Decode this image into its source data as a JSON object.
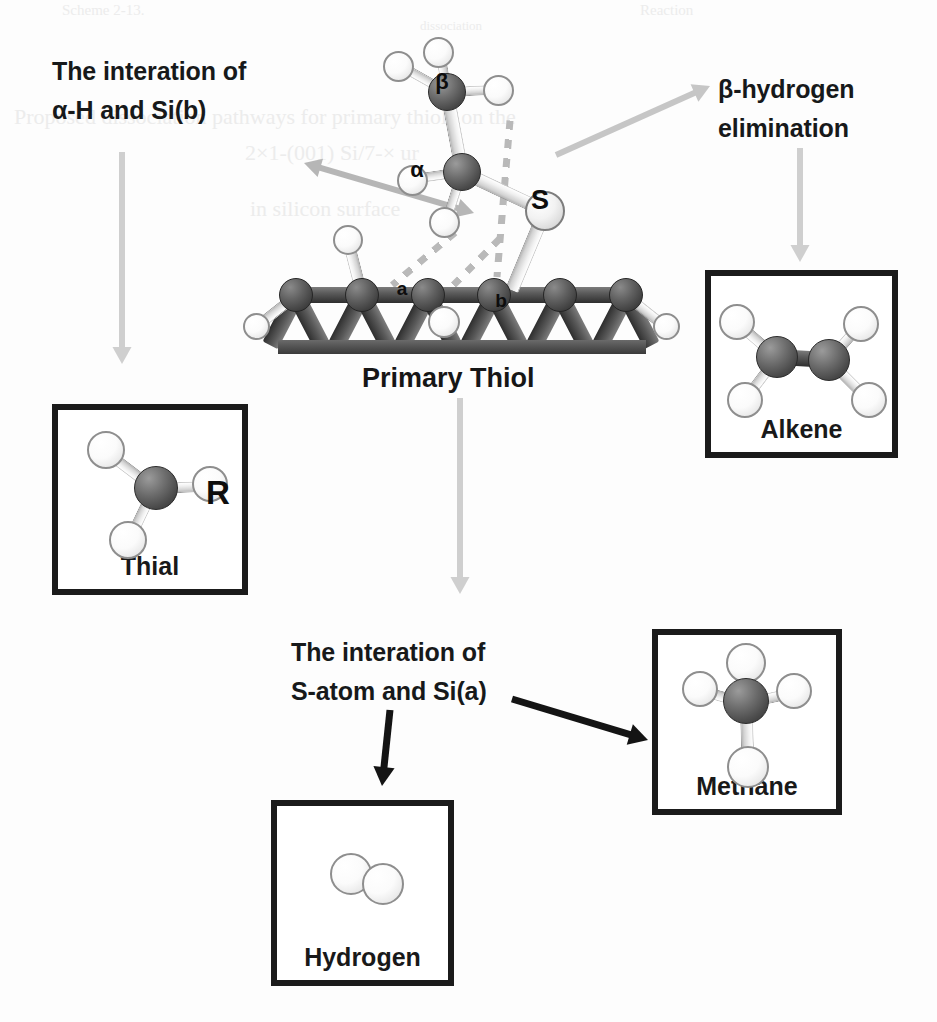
{
  "figure": {
    "background": "#fdfdfd",
    "center_caption": "Primary Thiol"
  },
  "ghost_text": [
    {
      "text": "Scheme 2-13.",
      "x": 62,
      "y": 2,
      "size": 15
    },
    {
      "text": "Reaction",
      "x": 640,
      "y": 2,
      "size": 15
    },
    {
      "text": "Proposed dissociation pathways for primary thiols on the",
      "x": 14,
      "y": 104,
      "size": 22
    },
    {
      "text": "2×1-(001) Si/7-× ur",
      "x": 245,
      "y": 140,
      "size": 22
    },
    {
      "text": "in silicon surface",
      "x": 250,
      "y": 196,
      "size": 22
    },
    {
      "text": "dissociation",
      "x": 420,
      "y": 18,
      "size": 13
    }
  ],
  "callouts": [
    {
      "name": "alpha-h-si-b-callout",
      "line1": "The interation of",
      "line2": "α-H and Si(b)",
      "x": 52,
      "y": 52
    },
    {
      "name": "beta-hydrogen-elimination-callout",
      "line1": "β-hydrogen",
      "line2": "elimination",
      "x": 718,
      "y": 70
    },
    {
      "name": "s-atom-si-a-callout",
      "line1": "The interation of",
      "line2": "S-atom and Si(a)",
      "x": 291,
      "y": 633
    }
  ],
  "center_structure": {
    "name": "primary-thiol-on-silicon",
    "caption": "Primary Thiol",
    "caption_x": 362,
    "caption_y": 363,
    "atom_labels": [
      {
        "text": "β",
        "x": 442,
        "y": 82,
        "size": 22
      },
      {
        "text": "α",
        "x": 417,
        "y": 170,
        "size": 22
      },
      {
        "text": "S",
        "x": 540,
        "y": 200,
        "size": 27
      },
      {
        "text": "a",
        "x": 402,
        "y": 288,
        "size": 19
      },
      {
        "text": "b",
        "x": 501,
        "y": 300,
        "size": 19
      }
    ]
  },
  "product_boxes": [
    {
      "name": "thial-box",
      "caption": "Thial",
      "x": 52,
      "y": 404,
      "width": 196,
      "height": 191,
      "molecule": "thial",
      "r_label": "R"
    },
    {
      "name": "alkene-box",
      "caption": "Alkene",
      "x": 705,
      "y": 270,
      "width": 193,
      "height": 188,
      "molecule": "alkene"
    },
    {
      "name": "hydrogen-box",
      "caption": "Hydrogen",
      "x": 271,
      "y": 800,
      "width": 183,
      "height": 186,
      "molecule": "hydrogen"
    },
    {
      "name": "methane-box",
      "caption": "Methane",
      "x": 652,
      "y": 629,
      "width": 190,
      "height": 186,
      "molecule": "methane"
    }
  ],
  "arrows": [
    {
      "name": "arrow-to-thial",
      "color": "#cfcfcf",
      "x1": 122,
      "y1": 152,
      "x2": 122,
      "y2": 364,
      "width": 6,
      "head": 17,
      "double": false
    },
    {
      "name": "arrow-to-alkene",
      "color": "#cfcfcf",
      "x1": 800,
      "y1": 148,
      "x2": 800,
      "y2": 262,
      "width": 6,
      "head": 17,
      "double": false
    },
    {
      "name": "arrow-to-bottom-center",
      "color": "#cfcfcf",
      "x1": 460,
      "y1": 398,
      "x2": 460,
      "y2": 594,
      "width": 6,
      "head": 17,
      "double": false
    },
    {
      "name": "arrow-alpha-h-interaction",
      "color": "#b6b6b6",
      "x1": 474,
      "y1": 213,
      "x2": 304,
      "y2": 163,
      "width": 6,
      "head": 17,
      "double": true
    },
    {
      "name": "arrow-beta-elimination",
      "color": "#c6c6c6",
      "x1": 556,
      "y1": 155,
      "x2": 710,
      "y2": 86,
      "width": 6,
      "head": 17,
      "double": false
    },
    {
      "name": "arrow-to-hydrogen",
      "color": "#141414",
      "x1": 390,
      "y1": 710,
      "x2": 382,
      "y2": 786,
      "width": 7,
      "head": 19,
      "double": false
    },
    {
      "name": "arrow-to-methane",
      "color": "#141414",
      "x1": 512,
      "y1": 699,
      "x2": 648,
      "y2": 740,
      "width": 7,
      "head": 19,
      "double": false
    }
  ]
}
